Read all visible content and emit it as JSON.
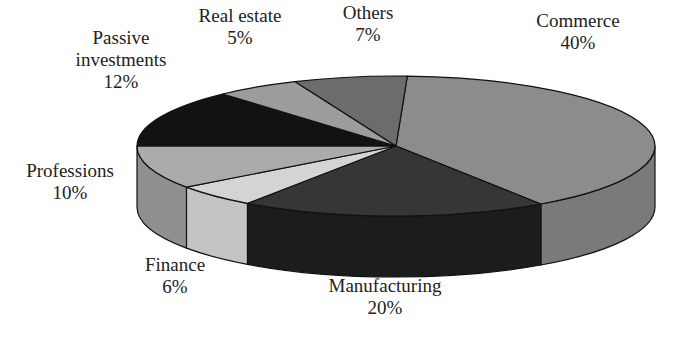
{
  "chart_data": {
    "type": "pie",
    "style": "3d",
    "title": "",
    "slices": [
      {
        "label": "Commerce",
        "value": 40,
        "pct_label": "40%",
        "color": "#8c8c8c",
        "side_color": "#7a7a7a",
        "t0": -87.5,
        "t1": 56
      },
      {
        "label": "Manufacturing",
        "value": 20,
        "pct_label": "20%",
        "color": "#363636",
        "side_color": "#1c1c1c",
        "t0": 56,
        "t1": 125
      },
      {
        "label": "Finance",
        "value": 6,
        "pct_label": "6%",
        "color": "#d4d4d4",
        "side_color": "#c4c4c4",
        "t0": 125,
        "t1": 144
      },
      {
        "label": "Professions",
        "value": 10,
        "pct_label": "10%",
        "color": "#ababab",
        "side_color": "#8f8f8f",
        "t0": 144,
        "t1": 180
      },
      {
        "label": "Passive investments",
        "value": 12,
        "pct_label": "12%",
        "color": "#121212",
        "side_color": "#0a0a0a",
        "t0": 180,
        "t1": 228
      },
      {
        "label": "Real estate",
        "value": 5,
        "pct_label": "5%",
        "color": "#9c9c9c",
        "side_color": "#888888",
        "t0": 228,
        "t1": 247
      },
      {
        "label": "Others",
        "value": 7,
        "pct_label": "7%",
        "color": "#6c6c6c",
        "side_color": "#5a5a5a",
        "t0": 247,
        "t1": 272.5
      }
    ],
    "legend": "none (inline labels)"
  },
  "labels": [
    {
      "lines": [
        "Commerce",
        "40%"
      ],
      "x": 578,
      "y": 10
    },
    {
      "lines": [
        "Others",
        "7%"
      ],
      "x": 368,
      "y": 2
    },
    {
      "lines": [
        "Real estate",
        "5%"
      ],
      "x": 240,
      "y": 5
    },
    {
      "lines": [
        "Passive",
        "investments",
        "12%"
      ],
      "x": 121,
      "y": 27
    },
    {
      "lines": [
        "Professions",
        "10%"
      ],
      "x": 70,
      "y": 160
    },
    {
      "lines": [
        "Finance",
        "6%"
      ],
      "x": 175,
      "y": 254
    },
    {
      "lines": [
        "Manufacturing",
        "20%"
      ],
      "x": 385,
      "y": 275
    }
  ]
}
